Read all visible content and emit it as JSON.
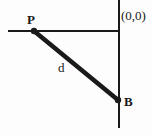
{
  "figure": {
    "type": "geometry-diagram",
    "background_color": "#fdfdfd",
    "stroke_color": "#1a1a1a"
  },
  "labels": {
    "point_p": "P",
    "point_b": "B",
    "segment_d": "d",
    "origin": "(0,0)"
  },
  "geometry": {
    "horizontal_axis": {
      "x1": 8,
      "y1": 31,
      "x2": 120,
      "y2": 31,
      "width": 2
    },
    "vertical_axis": {
      "x1": 119,
      "y1": 0,
      "x2": 119,
      "y2": 128,
      "width": 2
    },
    "segment_pb": {
      "x1": 34,
      "y1": 31,
      "x2": 118,
      "y2": 100,
      "width": 4
    },
    "point_p_marker": {
      "cx": 34,
      "cy": 31,
      "r": 3
    },
    "point_b_marker": {
      "cx": 118,
      "cy": 100,
      "r": 3
    }
  }
}
